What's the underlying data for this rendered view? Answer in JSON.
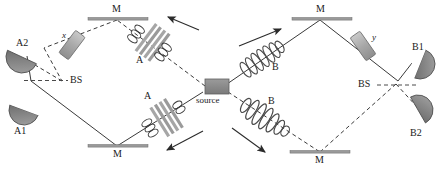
{
  "figure": {
    "type": "optical-interferometer-diagram",
    "background_color": "#ffffff",
    "stroke_color": "#333333",
    "element_fill": "#9a9a9a",
    "element_fill_dark": "#7d7d7d"
  },
  "labels": {
    "source": "source",
    "bs_left": "BS",
    "bs_right": "BS",
    "mirror_top_left": "M",
    "mirror_top_right": "M",
    "mirror_bottom_left": "M",
    "mirror_bottom_right": "M",
    "detector_a1": "A1",
    "detector_a2": "A2",
    "detector_b1": "B1",
    "detector_b2": "B2",
    "crystal_a_top": "A",
    "crystal_a_bottom": "A",
    "packet_b_top": "B",
    "packet_b_bottom": "B",
    "plate_x": "x",
    "plate_y": "y"
  },
  "components": [
    {
      "name": "source",
      "kind": "rectangle",
      "label": "source"
    },
    {
      "name": "beam-splitter-left",
      "kind": "beam-splitter",
      "label": "BS"
    },
    {
      "name": "beam-splitter-right",
      "kind": "beam-splitter",
      "label": "BS"
    },
    {
      "name": "mirror-top-left",
      "kind": "mirror",
      "label": "M"
    },
    {
      "name": "mirror-top-right",
      "kind": "mirror",
      "label": "M"
    },
    {
      "name": "mirror-bottom-left",
      "kind": "mirror",
      "label": "M"
    },
    {
      "name": "mirror-bottom-right",
      "kind": "mirror",
      "label": "M"
    },
    {
      "name": "detector-a1",
      "kind": "detector",
      "label": "A1"
    },
    {
      "name": "detector-a2",
      "kind": "detector",
      "label": "A2"
    },
    {
      "name": "detector-b1",
      "kind": "detector",
      "label": "B1"
    },
    {
      "name": "detector-b2",
      "kind": "detector",
      "label": "B2"
    },
    {
      "name": "crystal-a-top",
      "kind": "birefringent-crystal",
      "label": "A"
    },
    {
      "name": "crystal-a-bottom",
      "kind": "birefringent-crystal",
      "label": "A"
    },
    {
      "name": "wavepacket-b-top",
      "kind": "helix-wavepacket",
      "label": "B"
    },
    {
      "name": "wavepacket-b-bottom",
      "kind": "helix-wavepacket",
      "label": "B"
    },
    {
      "name": "phase-plate-x",
      "kind": "phase-plate",
      "label": "x"
    },
    {
      "name": "phase-plate-y",
      "kind": "phase-plate",
      "label": "y"
    }
  ]
}
